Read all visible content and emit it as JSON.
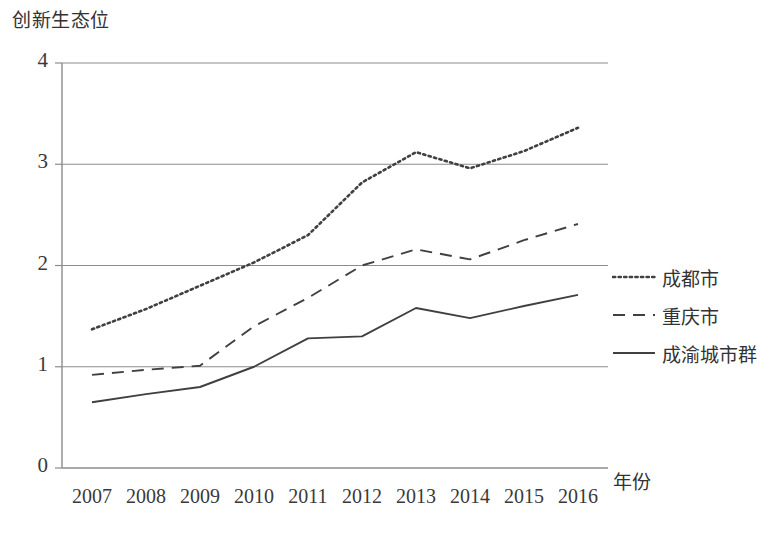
{
  "chart_data": {
    "type": "line",
    "title": "",
    "xlabel": "年份",
    "ylabel": "创新生态位",
    "x": [
      "2007",
      "2008",
      "2009",
      "2010",
      "2011",
      "2012",
      "2013",
      "2014",
      "2015",
      "2016"
    ],
    "categories": [
      "2007",
      "2008",
      "2009",
      "2010",
      "2011",
      "2012",
      "2013",
      "2014",
      "2015",
      "2016"
    ],
    "xlim": [
      2007,
      2016
    ],
    "ylim": [
      0,
      4
    ],
    "yticks": [
      "0",
      "1",
      "2",
      "3",
      "4"
    ],
    "ytick_values": [
      0,
      1,
      2,
      3,
      4
    ],
    "grid": "horizontal",
    "legend_position": "right",
    "series": [
      {
        "name": "成都市",
        "style": "dotted",
        "color": "#404040",
        "values": [
          1.37,
          1.57,
          1.8,
          2.03,
          2.3,
          2.82,
          3.12,
          2.96,
          3.13,
          3.36
        ]
      },
      {
        "name": "重庆市",
        "style": "dashed",
        "color": "#404040",
        "values": [
          0.92,
          0.97,
          1.01,
          1.4,
          1.68,
          2.0,
          2.16,
          2.06,
          2.25,
          2.41
        ]
      },
      {
        "name": "成渝城市群",
        "style": "solid",
        "color": "#404040",
        "values": [
          0.65,
          0.73,
          0.8,
          1.0,
          1.28,
          1.3,
          1.58,
          1.48,
          1.6,
          1.71
        ]
      }
    ]
  },
  "axis": {
    "y_title": "创新生态位",
    "x_title": "年份"
  },
  "legend": {
    "items": [
      {
        "label": "成都市",
        "style": "dotted"
      },
      {
        "label": "重庆市",
        "style": "dashed"
      },
      {
        "label": "成渝城市群",
        "style": "solid"
      }
    ]
  },
  "colors": {
    "line": "#404040",
    "grid": "#8c8c8c",
    "axis": "#8c8c8c",
    "text": "#3a3a3a"
  }
}
